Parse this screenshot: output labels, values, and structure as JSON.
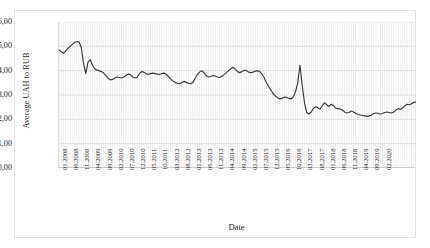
{
  "chart_data": {
    "type": "line",
    "title": "",
    "xlabel": "Date",
    "ylabel": "Average UAH to RUB",
    "ylim": [
      0,
      6
    ],
    "ytick_labels": [
      "6,00",
      "5,00",
      "4,00",
      "3,00",
      "2,00",
      "1,00",
      "0,00"
    ],
    "ytick_values": [
      6,
      5,
      4,
      3,
      2,
      1,
      0
    ],
    "grid": "both",
    "legend": "none",
    "decimal_separator": ",",
    "xtick_labels": [
      "01.2008",
      "06.2008",
      "11.2008",
      "04.2009",
      "09.2009",
      "02.2010",
      "07.2010",
      "12.2010",
      "05.2011",
      "10.2011",
      "03.2012",
      "08.2012",
      "01.2013",
      "06.2013",
      "11.2013",
      "04.2014",
      "09.2014",
      "02.2015",
      "07.2015",
      "12.2015",
      "05.2016",
      "10.2016",
      "03.2017",
      "08.2017",
      "01.2018",
      "06.2018",
      "11.2018",
      "04.2019",
      "09.2019",
      "02.2020"
    ],
    "xtick_interval_months": 5,
    "x_start": "01.2008",
    "x_end": "02.2020",
    "n_points": 146,
    "series": [
      {
        "name": "Average UAH to RUB",
        "color": "#3a3a3a",
        "values": [
          4.85,
          4.78,
          4.72,
          4.8,
          4.92,
          5.0,
          5.08,
          5.16,
          5.2,
          5.18,
          4.95,
          4.3,
          3.88,
          4.35,
          4.45,
          4.22,
          4.08,
          4.02,
          4.0,
          3.96,
          3.9,
          3.8,
          3.7,
          3.62,
          3.64,
          3.7,
          3.74,
          3.72,
          3.7,
          3.74,
          3.8,
          3.86,
          3.84,
          3.74,
          3.7,
          3.72,
          3.88,
          3.96,
          3.94,
          3.88,
          3.86,
          3.88,
          3.9,
          3.88,
          3.86,
          3.84,
          3.88,
          3.9,
          3.86,
          3.76,
          3.66,
          3.58,
          3.52,
          3.48,
          3.46,
          3.5,
          3.56,
          3.52,
          3.48,
          3.46,
          3.52,
          3.68,
          3.84,
          3.94,
          4.0,
          3.92,
          3.8,
          3.74,
          3.76,
          3.8,
          3.78,
          3.74,
          3.72,
          3.76,
          3.84,
          3.92,
          4.0,
          4.08,
          4.14,
          4.06,
          3.96,
          3.92,
          3.96,
          4.02,
          4.0,
          3.94,
          3.92,
          3.94,
          3.98,
          4.0,
          3.96,
          3.86,
          3.7,
          3.5,
          3.34,
          3.2,
          3.05,
          2.96,
          2.88,
          2.84,
          2.86,
          2.92,
          2.9,
          2.86,
          2.84,
          2.92,
          3.12,
          3.5,
          4.22,
          3.4,
          2.7,
          2.28,
          2.22,
          2.3,
          2.44,
          2.52,
          2.48,
          2.42,
          2.56,
          2.68,
          2.6,
          2.52,
          2.62,
          2.56,
          2.46,
          2.44,
          2.42,
          2.38,
          2.3,
          2.26,
          2.28,
          2.34,
          2.3,
          2.24,
          2.2,
          2.18,
          2.16,
          2.14,
          2.12,
          2.14,
          2.18,
          2.24,
          2.26,
          2.24,
          2.22,
          2.24,
          2.28,
          2.3,
          2.28,
          2.26,
          2.3,
          2.38,
          2.44,
          2.42,
          2.46,
          2.56,
          2.62,
          2.6,
          2.64,
          2.7,
          2.72
        ]
      }
    ]
  }
}
